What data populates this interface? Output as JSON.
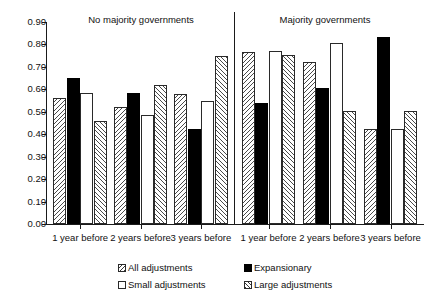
{
  "chart_data": {
    "type": "bar",
    "title": "",
    "xlabel": "",
    "ylabel": "",
    "ylim": [
      0.0,
      0.9
    ],
    "ytick_labels": [
      "0.90",
      "0.80",
      "0.70",
      "0.60",
      "0.50",
      "0.40",
      "0.30",
      "0.20",
      "0.10",
      "0.00"
    ],
    "ytick_values": [
      0.9,
      0.8,
      0.7,
      0.6,
      0.5,
      0.4,
      0.3,
      0.2,
      0.1,
      0.0
    ],
    "grid": false,
    "legend_position": "bottom",
    "panels": [
      {
        "title": "No majority governments",
        "categories": [
          "1 year before",
          "2 years before",
          "3 years before"
        ],
        "series": [
          {
            "name": "All adjustments",
            "pattern": "pat-all",
            "values": [
              0.56,
              0.52,
              0.58
            ]
          },
          {
            "name": "Expansionary",
            "pattern": "pat-exp",
            "values": [
              0.65,
              0.585,
              0.425
            ]
          },
          {
            "name": "Small adjustments",
            "pattern": "pat-small",
            "values": [
              0.585,
              0.487,
              0.548
            ]
          },
          {
            "name": "Large adjustments",
            "pattern": "pat-large",
            "values": [
              0.46,
              0.618,
              0.75
            ]
          }
        ]
      },
      {
        "title": "Majority governments",
        "categories": [
          "1 year before",
          "2 years before",
          "3 years before"
        ],
        "series": [
          {
            "name": "All adjustments",
            "pattern": "pat-all",
            "values": [
              0.765,
              0.72,
              0.425
            ]
          },
          {
            "name": "Expansionary",
            "pattern": "pat-exp",
            "values": [
              0.54,
              0.605,
              0.835
            ]
          },
          {
            "name": "Small adjustments",
            "pattern": "pat-small",
            "values": [
              0.77,
              0.805,
              0.425
            ]
          },
          {
            "name": "Large adjustments",
            "pattern": "pat-large",
            "values": [
              0.755,
              0.505,
              0.505
            ]
          }
        ]
      }
    ],
    "legend": [
      {
        "label": "All adjustments",
        "pattern": "pat-all"
      },
      {
        "label": "Expansionary",
        "pattern": "pat-exp"
      },
      {
        "label": "Small adjustments",
        "pattern": "pat-small"
      },
      {
        "label": "Large adjustments",
        "pattern": "pat-large"
      }
    ],
    "colors": {
      "hatch": "#4a4a4a",
      "solid": "#000000",
      "empty": "#ffffff",
      "axis": "#1a1a1a",
      "text": "#111111"
    }
  }
}
